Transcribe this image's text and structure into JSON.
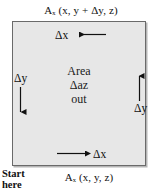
{
  "figure": {
    "type": "vector-field-circulation-cell",
    "title_top": "Aₓ (x, y + Δy, z)",
    "title_bottom": "Aₓ (x, y, z)",
    "box": {
      "fill_color": "#e7e7e7",
      "border_color": "#6a6a6a",
      "shadow_color": "#787878"
    },
    "center_text": {
      "line1": "Area",
      "line2": "Δaᴢ",
      "line3": "out"
    },
    "edge_labels": {
      "top": "Δx",
      "bottom": "Δx",
      "left": "Δy",
      "right": "Δy"
    },
    "arrows": [
      {
        "name": "top-arrow",
        "direction": "left",
        "label": "Δx"
      },
      {
        "name": "bottom-arrow",
        "direction": "right",
        "label": "Δx"
      },
      {
        "name": "left-arrow",
        "direction": "down",
        "label": "Δy"
      },
      {
        "name": "right-arrow",
        "direction": "up",
        "label": "Δy"
      }
    ],
    "annotation": {
      "start_line1": "Start",
      "start_line2": "here"
    }
  }
}
